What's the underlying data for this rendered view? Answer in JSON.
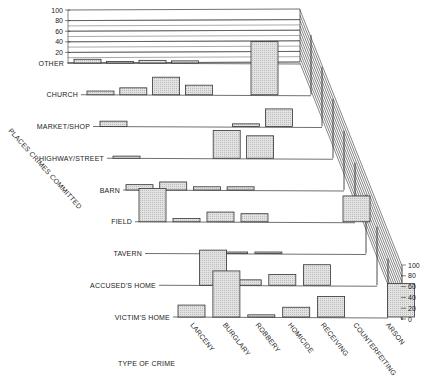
{
  "chart_data": {
    "type": "bar",
    "subtype": "3d-grouped-perspective",
    "title": "",
    "xlabel": "TYPE OF CRIME",
    "ylabel": "PLACES CRIMES COMMITTED",
    "zlabel_ticks": [
      "0",
      "20",
      "40",
      "60",
      "80",
      "100"
    ],
    "ylim": [
      0,
      100
    ],
    "categories": [
      "LARCENY",
      "BURGLARY",
      "ROBBERY",
      "HOMICIDE",
      "RECEIVING",
      "COUNTERFEITING",
      "ARSON"
    ],
    "rows": [
      "OTHER",
      "CHURCH",
      "MARKET/SHOP",
      "HIGHWAY/STREET",
      "BARN",
      "FIELD",
      "TAVERN",
      "ACCUSED'S HOME",
      "VICTIM'S HOME"
    ],
    "series": [
      {
        "name": "OTHER",
        "values": [
          7,
          2,
          5,
          4,
          0,
          0,
          0
        ]
      },
      {
        "name": "CHURCH",
        "values": [
          7,
          13,
          33,
          18,
          0,
          100,
          0
        ]
      },
      {
        "name": "MARKET/SHOP",
        "values": [
          10,
          0,
          0,
          0,
          5,
          33,
          0
        ]
      },
      {
        "name": "HIGHWAY/STREET",
        "values": [
          4,
          0,
          0,
          52,
          42,
          0,
          0
        ]
      },
      {
        "name": "BARN",
        "values": [
          10,
          15,
          6,
          6,
          0,
          0,
          0
        ]
      },
      {
        "name": "FIELD",
        "values": [
          62,
          6,
          18,
          15,
          0,
          0,
          48
        ]
      },
      {
        "name": "TAVERN",
        "values": [
          0,
          0,
          1,
          1,
          0,
          0,
          0
        ]
      },
      {
        "name": "ACCUSED'S HOME",
        "values": [
          0,
          65,
          10,
          20,
          38,
          0,
          0
        ]
      },
      {
        "name": "VICTIM'S HOME",
        "values": [
          22,
          85,
          4,
          18,
          38,
          0,
          62
        ]
      }
    ]
  },
  "labels": {
    "xlabel": "TYPE OF CRIME",
    "ylabel": "PLACES CRIMES COMMITTED",
    "left_ticks": [
      "100",
      "80",
      "60",
      "40",
      "20"
    ],
    "right_ticks": [
      "100",
      "80",
      "60",
      "40",
      "20",
      "0"
    ]
  }
}
